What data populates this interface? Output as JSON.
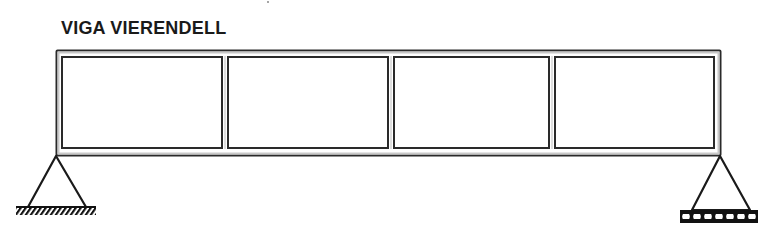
{
  "title": "VIGA VIERENDELL",
  "diagram": {
    "type": "vierendeel-beam",
    "panels": 4,
    "supports": [
      {
        "position": "left",
        "kind": "pinned"
      },
      {
        "position": "right",
        "kind": "roller"
      }
    ],
    "colors": {
      "line": "#2a2a2a",
      "fill": "#ffffff",
      "chord_gap": "#bdbdbd"
    }
  }
}
